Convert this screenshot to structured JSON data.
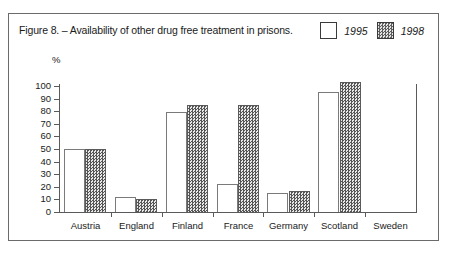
{
  "figure": {
    "caption": "Figure 8. – Availability of other drug free treatment in prisons."
  },
  "legend": {
    "position": "top-right",
    "entries": [
      {
        "label": "1995",
        "swatch": "white-box",
        "color": "#ffffff"
      },
      {
        "label": "1998",
        "swatch": "hatched-box",
        "color": "#b4b4b4"
      }
    ]
  },
  "axes": {
    "y_unit": "%",
    "y_ticks": [
      "0",
      "10",
      "20",
      "30",
      "40",
      "50",
      "60",
      "70",
      "80",
      "90",
      "100"
    ]
  },
  "chart_data": {
    "type": "bar",
    "title": "Figure 8. – Availability of other drug free treatment in prisons.",
    "xlabel": "",
    "ylabel": "%",
    "ylim": [
      0,
      100
    ],
    "grid": false,
    "legend_position": "top-right",
    "categories": [
      "Austria",
      "England",
      "Finland",
      "France",
      "Germany",
      "Scotland",
      "Sweden"
    ],
    "series": [
      {
        "name": "1995",
        "values": [
          50,
          12,
          79,
          22,
          15,
          95,
          0
        ]
      },
      {
        "name": "1998",
        "values": [
          50,
          10,
          85,
          85,
          17,
          103,
          0
        ]
      }
    ]
  }
}
